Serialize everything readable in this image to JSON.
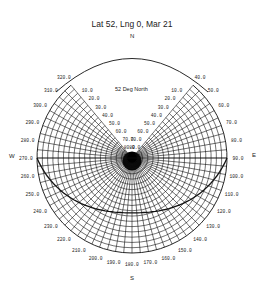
{
  "title": "Lat 52, Lng 0, Mar 21",
  "subtitle": "52 Deg North",
  "compass": {
    "north": "N",
    "south": "S",
    "east": "E",
    "west": "W"
  },
  "colors": {
    "line": "#111111",
    "background": "#ffffff"
  },
  "chart_data": {
    "type": "polar-sun-path",
    "title": "Lat 52, Lng 0, Mar 21",
    "annotation": "52 Deg North",
    "latitude": 52,
    "longitude": 0,
    "date": "Mar 21",
    "center": [
      132,
      158
    ],
    "outer_radius": 95,
    "azimuth_labels": [
      "40.0",
      "50.0",
      "60.0",
      "70.0",
      "80.0",
      "90.0",
      "100.0",
      "110.0",
      "120.0",
      "130.0",
      "140.0",
      "150.0",
      "160.0",
      "170.0",
      "180.0",
      "190.0",
      "200.0",
      "210.0",
      "220.0",
      "230.0",
      "240.0",
      "250.0",
      "260.0",
      "270.0",
      "280.0",
      "290.0",
      "300.0",
      "310.0",
      "320.0"
    ],
    "azimuth_range_deg": [
      40,
      320
    ],
    "altitude_labels": [
      "10.0",
      "20.0",
      "30.0",
      "40.0",
      "50.0",
      "60.0",
      "70.0",
      "80.0"
    ],
    "altitude_range_deg": [
      0,
      90
    ],
    "sun_path": {
      "description": "Equinox sun path from sunrise at E (90) through S to sunset at W (270)",
      "sunrise_azimuth": 90,
      "sunset_azimuth": 270,
      "max_altitude": 38
    }
  }
}
